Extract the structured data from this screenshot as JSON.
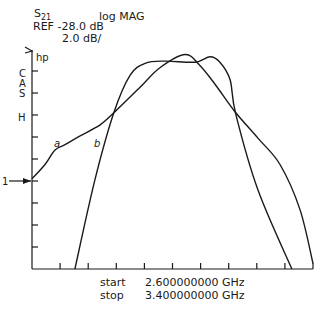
{
  "header": {
    "param_base": "S",
    "param_sub": "21",
    "format": "log MAG",
    "ref": "REF -28.0 dB",
    "scale": "2.0 dB/"
  },
  "footer": {
    "start_label": "start",
    "start_value": "2.600000000 GHz",
    "stop_label": "stop",
    "stop_value": "3.400000000 GHz"
  },
  "chart_data": {
    "type": "line",
    "xlabel": "Frequency (GHz)",
    "ylabel": "S21 (dB)",
    "xlim": [
      2.6,
      3.4
    ],
    "ylim": [
      -36.0,
      -18.0
    ],
    "x_divisions": 10,
    "y_divisions": 9,
    "reference_level_db": -28.0,
    "scale_db_per_div": 2.0,
    "reference_marker_label": "1",
    "y_annotations": [
      "hp",
      "C",
      "A",
      "S",
      "H"
    ],
    "grid": false,
    "series": [
      {
        "name": "a",
        "x": [
          2.6,
          2.637,
          2.665,
          2.694,
          2.737,
          2.794,
          2.833,
          2.907,
          2.964,
          3.036,
          3.078,
          3.121,
          3.178,
          3.243,
          3.306,
          3.363,
          3.4
        ],
        "y": [
          -27.8,
          -26.5,
          -25.2,
          -24.7,
          -23.9,
          -22.9,
          -21.8,
          -19.5,
          -17.7,
          -16.5,
          -17.5,
          -19.2,
          -21.7,
          -24.1,
          -26.5,
          -30.6,
          -35.5
        ]
      },
      {
        "name": "b",
        "x": [
          2.722,
          2.779,
          2.833,
          2.879,
          2.922,
          2.979,
          3.064,
          3.107,
          3.135,
          3.164,
          3.18,
          3.243,
          3.34
        ],
        "y": [
          -36.0,
          -27.9,
          -21.8,
          -18.4,
          -17.3,
          -17.1,
          -17.2,
          -16.7,
          -17.2,
          -18.8,
          -21.9,
          -28.8,
          -36.0
        ]
      }
    ]
  }
}
